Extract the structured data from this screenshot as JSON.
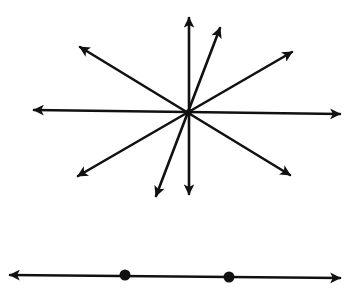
{
  "diagram": {
    "title": "",
    "stroke_color": "#111111",
    "background": "#ffffff",
    "pencil": {
      "description": "Pencil of lines through a single common point",
      "center": [
        189,
        112
      ],
      "lines": [
        {
          "id": "horizontal",
          "a": [
            34,
            110
          ],
          "b": [
            340,
            114
          ]
        },
        {
          "id": "vertical",
          "a": [
            189,
            18
          ],
          "b": [
            189,
            194
          ]
        },
        {
          "id": "steep",
          "a": [
            220,
            28
          ],
          "b": [
            156,
            196
          ]
        },
        {
          "id": "shallow-positive",
          "a": [
            292,
            52
          ],
          "b": [
            78,
            176
          ]
        },
        {
          "id": "shallow-negative",
          "a": [
            80,
            47
          ],
          "b": [
            290,
            175
          ]
        }
      ]
    },
    "line_with_points": {
      "description": "Line with two marked points",
      "a": [
        10,
        275
      ],
      "b": [
        340,
        278
      ],
      "points": [
        [
          125,
          275
        ],
        [
          229,
          277
        ]
      ]
    }
  }
}
